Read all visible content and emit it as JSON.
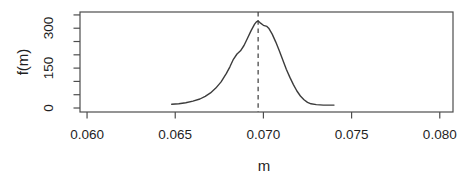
{
  "figure": {
    "background": "#ffffff",
    "line_color": "#3c3c3c",
    "axis_color": "#4d4d4d",
    "text_color": "#1f1f1f"
  },
  "chart_data": {
    "type": "line",
    "title": "",
    "xlabel": "m",
    "ylabel": "f(m)",
    "xlim": [
      0.0596,
      0.08075
    ],
    "ylim": [
      -15,
      361
    ],
    "grid": false,
    "legend": null,
    "x_ticks": [
      0.06,
      0.065,
      0.07,
      0.075,
      0.08
    ],
    "x_tick_labels": [
      "0.060",
      "0.065",
      "0.070",
      "0.075",
      "0.080"
    ],
    "y_ticks": [
      0,
      50,
      100,
      150,
      200,
      250,
      300,
      350
    ],
    "y_tick_labels": [
      "0",
      "",
      "",
      "150",
      "",
      "",
      "300",
      ""
    ],
    "vline": {
      "x": 0.0697,
      "style": "dashed"
    },
    "series": [
      {
        "name": "density",
        "points": [
          [
            0.0648,
            14
          ],
          [
            0.0652,
            16
          ],
          [
            0.0656,
            20
          ],
          [
            0.066,
            26
          ],
          [
            0.0664,
            34
          ],
          [
            0.0667,
            44
          ],
          [
            0.067,
            57
          ],
          [
            0.0673,
            75
          ],
          [
            0.0676,
            98
          ],
          [
            0.0679,
            130
          ],
          [
            0.0681,
            155
          ],
          [
            0.0683,
            183
          ],
          [
            0.0685,
            203
          ],
          [
            0.0687,
            215
          ],
          [
            0.0689,
            235
          ],
          [
            0.0691,
            262
          ],
          [
            0.0693,
            291
          ],
          [
            0.0695,
            315
          ],
          [
            0.0696,
            324
          ],
          [
            0.0697,
            327
          ],
          [
            0.0698,
            321
          ],
          [
            0.07,
            311
          ],
          [
            0.0702,
            307
          ],
          [
            0.0703,
            300
          ],
          [
            0.0705,
            278
          ],
          [
            0.0707,
            248
          ],
          [
            0.0709,
            215
          ],
          [
            0.0711,
            180
          ],
          [
            0.0713,
            146
          ],
          [
            0.0715,
            115
          ],
          [
            0.0717,
            88
          ],
          [
            0.0719,
            64
          ],
          [
            0.0721,
            45
          ],
          [
            0.0723,
            31
          ],
          [
            0.0725,
            21
          ],
          [
            0.0727,
            16
          ],
          [
            0.073,
            13
          ],
          [
            0.0734,
            11
          ],
          [
            0.0737,
            11
          ],
          [
            0.074,
            11
          ]
        ]
      }
    ]
  }
}
